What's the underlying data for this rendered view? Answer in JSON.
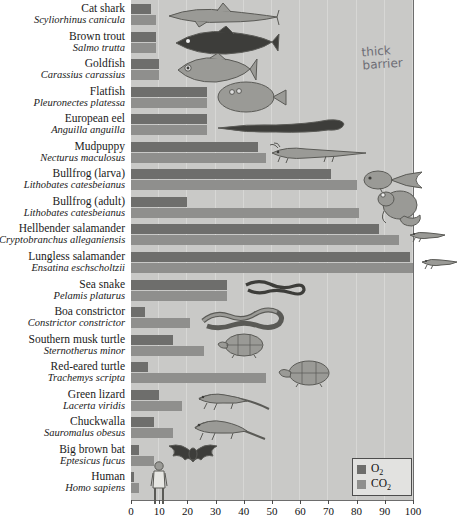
{
  "chart_data": {
    "type": "bar",
    "title": "",
    "xlabel": "",
    "ylabel": "",
    "xlim": [
      0,
      100
    ],
    "xticks": [
      0,
      10,
      20,
      30,
      40,
      50,
      60,
      70,
      80,
      90,
      100
    ],
    "grid": true,
    "orientation": "horizontal",
    "legend_position": "bottom-right",
    "series": [
      {
        "name": "O2",
        "color": "#6e6e6c",
        "values": [
          7,
          9,
          10,
          27,
          27,
          45,
          71,
          20,
          88,
          99,
          34,
          5,
          15,
          6,
          10,
          8,
          3,
          1
        ]
      },
      {
        "name": "CO2",
        "color": "#8f8f8d",
        "values": [
          9,
          9,
          10,
          27,
          27,
          48,
          80,
          81,
          95,
          100,
          34,
          21,
          26,
          48,
          18,
          15,
          8,
          3
        ]
      }
    ],
    "categories": [
      "Cat shark",
      "Brown trout",
      "Goldfish",
      "Flatfish",
      "European eel",
      "Mudpuppy",
      "Bullfrog (larva)",
      "Bullfrog (adult)",
      "Hellbender salamander",
      "Lungless salamander",
      "Sea snake",
      "Boa constrictor",
      "Southern musk turtle",
      "Red-eared turtle",
      "Green lizard",
      "Chuckwalla",
      "Big brown bat",
      "Human"
    ],
    "rows": [
      {
        "common": "Cat shark",
        "sci": "Scyliorhinus canicula",
        "o2": 7,
        "co2": 9,
        "icon": "shark-icon"
      },
      {
        "common": "Brown trout",
        "sci": "Salmo trutta",
        "o2": 9,
        "co2": 9,
        "icon": "trout-icon"
      },
      {
        "common": "Goldfish",
        "sci": "Carassius carassius",
        "o2": 10,
        "co2": 10,
        "icon": "goldfish-icon"
      },
      {
        "common": "Flatfish",
        "sci": "Pleuronectes platessa",
        "o2": 27,
        "co2": 27,
        "icon": "flatfish-icon"
      },
      {
        "common": "European eel",
        "sci": "Anguilla anguilla",
        "o2": 27,
        "co2": 27,
        "icon": "eel-icon"
      },
      {
        "common": "Mudpuppy",
        "sci": "Necturus maculosus",
        "o2": 45,
        "co2": 48,
        "icon": "mudpuppy-icon"
      },
      {
        "common": "Bullfrog (larva)",
        "sci": "Lithobates catesbeianus",
        "o2": 71,
        "co2": 80,
        "icon": "tadpole-icon"
      },
      {
        "common": "Bullfrog (adult)",
        "sci": "Lithobates catesbeianus",
        "o2": 20,
        "co2": 81,
        "icon": "frog-icon"
      },
      {
        "common": "Hellbender salamander",
        "sci": "Cryptobranchus alleganiensis",
        "o2": 88,
        "co2": 95,
        "icon": "hellbender-icon"
      },
      {
        "common": "Lungless salamander",
        "sci": "Ensatina eschscholtzii",
        "o2": 99,
        "co2": 100,
        "icon": "salamander-icon"
      },
      {
        "common": "Sea snake",
        "sci": "Pelamis platurus",
        "o2": 34,
        "co2": 34,
        "icon": "sea-snake-icon"
      },
      {
        "common": "Boa constrictor",
        "sci": "Constrictor constrictor",
        "o2": 5,
        "co2": 21,
        "icon": "boa-icon"
      },
      {
        "common": "Southern musk turtle",
        "sci": "Sternotherus minor",
        "o2": 15,
        "co2": 26,
        "icon": "musk-turtle-icon"
      },
      {
        "common": "Red-eared turtle",
        "sci": "Trachemys scripta",
        "o2": 6,
        "co2": 48,
        "icon": "red-eared-turtle-icon"
      },
      {
        "common": "Green lizard",
        "sci": "Lacerta viridis",
        "o2": 10,
        "co2": 18,
        "icon": "green-lizard-icon"
      },
      {
        "common": "Chuckwalla",
        "sci": "Sauromalus obesus",
        "o2": 8,
        "co2": 15,
        "icon": "chuckwalla-icon"
      },
      {
        "common": "Big brown bat",
        "sci": "Eptesicus fucus",
        "o2": 3,
        "co2": 8,
        "icon": "bat-icon"
      },
      {
        "common": "Human",
        "sci": "Homo sapiens",
        "o2": 1,
        "co2": 3,
        "icon": "human-icon"
      }
    ]
  },
  "legend": {
    "items": [
      {
        "label": "O",
        "sub": "2",
        "color": "#6e6e6c",
        "name": "o2"
      },
      {
        "label": "CO",
        "sub": "2",
        "color": "#8f8f8d",
        "name": "co2"
      }
    ]
  },
  "axis": {
    "ticks": [
      "0",
      "10",
      "20",
      "30",
      "40",
      "50",
      "60",
      "70",
      "80",
      "90",
      "100"
    ]
  },
  "annotation": {
    "line1": "thick",
    "line2": "barrier"
  },
  "colors": {
    "o2": "#6e6e6c",
    "co2": "#8f8f8d",
    "plot_background": "#c9c9c7",
    "gridline": "#d7d7d5"
  }
}
